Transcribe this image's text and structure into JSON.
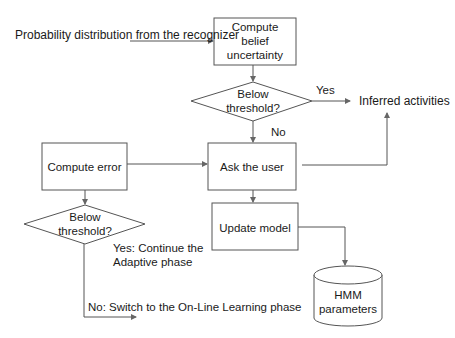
{
  "diagram": {
    "input_label": "Probability distribution from the recognizer",
    "nodes": {
      "compute_belief": [
        "Compute",
        "belief",
        "uncertainty"
      ],
      "decision_top": [
        "Below",
        "threshold?"
      ],
      "inferred": "Inferred activities",
      "ask_user": "Ask the user",
      "compute_error": "Compute error",
      "decision_bottom": [
        "Below",
        "threshold?"
      ],
      "update_model": "Update model",
      "hmm": [
        "HMM",
        "parameters"
      ]
    },
    "edge_labels": {
      "yes_top": "Yes",
      "no_top": "No",
      "yes_bottom": [
        "Yes: Continue the",
        "Adaptive phase"
      ],
      "no_bottom": "No: Switch to the On-Line Learning phase"
    },
    "colors": {
      "stroke": "#555555",
      "text": "#1a1a1a",
      "background": "#ffffff"
    }
  }
}
